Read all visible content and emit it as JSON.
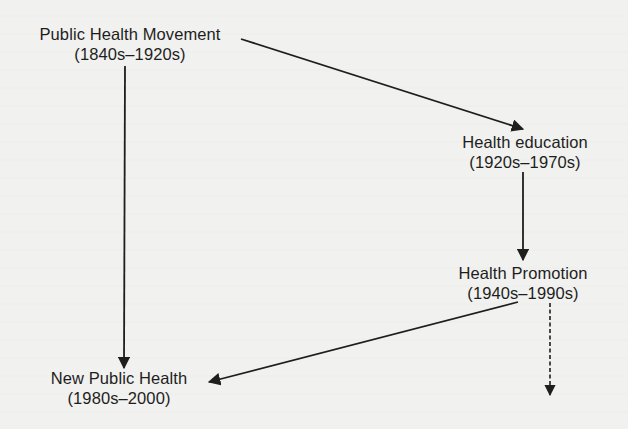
{
  "diagram": {
    "nodes": [
      {
        "id": "public-health-movement",
        "title": "Public Health Movement",
        "period": "(1840s–1920s)"
      },
      {
        "id": "health-education",
        "title": "Health education",
        "period": "(1920s–1970s)"
      },
      {
        "id": "health-promotion",
        "title": "Health Promotion",
        "period": "(1940s–1990s)"
      },
      {
        "id": "new-public-health",
        "title": "New Public Health",
        "period": "(1980s–2000)"
      }
    ],
    "edges": [
      {
        "from": "public-health-movement",
        "to": "health-education",
        "style": "solid"
      },
      {
        "from": "health-education",
        "to": "health-promotion",
        "style": "solid"
      },
      {
        "from": "public-health-movement",
        "to": "new-public-health",
        "style": "solid"
      },
      {
        "from": "health-promotion",
        "to": "new-public-health",
        "style": "solid"
      },
      {
        "from": "health-promotion",
        "to": "continuation",
        "style": "dashed"
      }
    ],
    "colors": {
      "background": "#f1f1ef",
      "ink": "#1e1e1e"
    }
  }
}
